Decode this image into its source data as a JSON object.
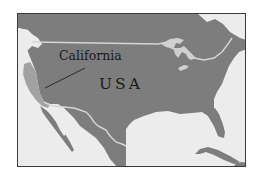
{
  "map": {
    "title": "",
    "colors": {
      "land": "#7d7d7d",
      "water": "#ececec",
      "highlight_state": "#a2a2a2",
      "border": "#d6d6d6",
      "frame": "#3a3a3a",
      "text": "#1a1a1a"
    },
    "labels": {
      "state": "California",
      "country": "USA"
    },
    "highlighted_region": "California",
    "features": [
      "Canada border",
      "Great Lakes",
      "Mexico border",
      "Baja California",
      "Gulf of Mexico",
      "Florida",
      "Cuba"
    ]
  }
}
